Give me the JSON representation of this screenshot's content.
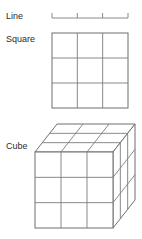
{
  "figure": {
    "background_color": "#ffffff",
    "stroke_color": "#7d7d7d",
    "label_color": "#2b2b2b",
    "divisions_per_dimension": 3,
    "rows": [
      {
        "key": "line",
        "label": "Line",
        "dimension": 1,
        "parts": 3,
        "label_x": 6,
        "label_y": 17
      },
      {
        "key": "square",
        "label": "Square",
        "dimension": 2,
        "parts": 9,
        "label_x": 6,
        "label_y": 40
      },
      {
        "key": "cube",
        "label": "Cube",
        "dimension": 3,
        "parts": 27,
        "label_x": 6,
        "label_y": 147
      }
    ],
    "line_geometry": {
      "x_start": 52,
      "x_end": 128,
      "baseline_y": 18,
      "tick_height": 5,
      "tick_positions": [
        52,
        77.3,
        102.6,
        128
      ]
    },
    "square_geometry": {
      "x_left": 52,
      "x_right": 128,
      "y_top": 33,
      "y_bottom": 108,
      "columns": 3,
      "rows": 3
    },
    "cube_geometry": {
      "front_x_left": 35,
      "front_x_right": 113,
      "front_y_top": 152,
      "front_y_bottom": 228,
      "depth_dx": 22,
      "depth_dy": -28,
      "columns": 3,
      "rows": 3,
      "layers": 3
    }
  }
}
